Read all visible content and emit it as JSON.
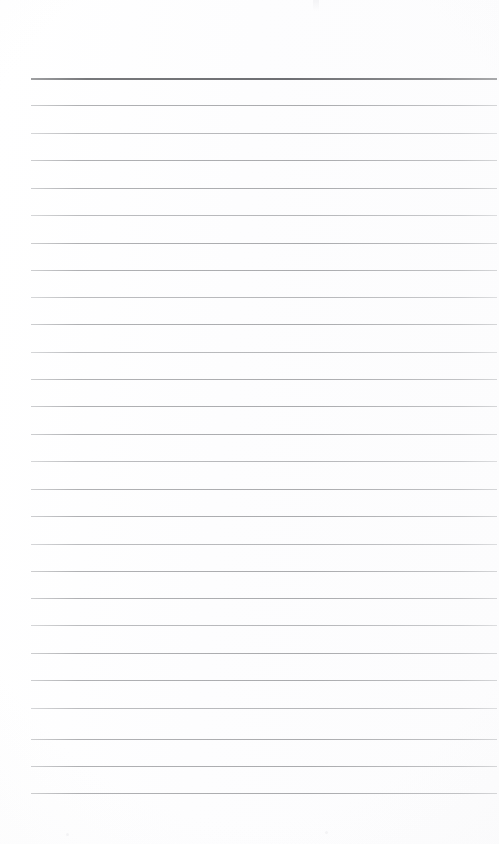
{
  "document": {
    "kind": "scanned-ruled-notebook-page",
    "title": "Blank Ruled Page",
    "content_text": "",
    "page_width": 499,
    "page_height": 844,
    "background_color": "#fefefe",
    "rule_color": "#b4b5b7",
    "header_rule_color": "#6e6f73",
    "margin_left": 31,
    "margin_right": 497,
    "first_rule_y": 78,
    "rule_spacing": 27.4,
    "rule_count": 27,
    "top_margin_blank_px": 78,
    "bottom_margin_blank_px": 51,
    "has_vertical_margin_line": false,
    "has_text": false,
    "rules": [
      {
        "index": 0,
        "y": 78,
        "weight": "heavy",
        "x_start": 31,
        "x_end": 497
      },
      {
        "index": 1,
        "y": 105,
        "weight": "light",
        "x_start": 31,
        "x_end": 497
      },
      {
        "index": 2,
        "y": 133,
        "weight": "faint",
        "x_start": 31,
        "x_end": 497
      },
      {
        "index": 3,
        "y": 160,
        "weight": "light",
        "x_start": 31,
        "x_end": 497
      },
      {
        "index": 4,
        "y": 188,
        "weight": "light",
        "x_start": 31,
        "x_end": 497
      },
      {
        "index": 5,
        "y": 215,
        "weight": "faint",
        "x_start": 31,
        "x_end": 497
      },
      {
        "index": 6,
        "y": 243,
        "weight": "light",
        "x_start": 31,
        "x_end": 497
      },
      {
        "index": 7,
        "y": 270,
        "weight": "light",
        "x_start": 31,
        "x_end": 497
      },
      {
        "index": 8,
        "y": 297,
        "weight": "faint",
        "x_start": 31,
        "x_end": 497
      },
      {
        "index": 9,
        "y": 324,
        "weight": "light",
        "x_start": 31,
        "x_end": 497
      },
      {
        "index": 10,
        "y": 352,
        "weight": "faint",
        "x_start": 31,
        "x_end": 497
      },
      {
        "index": 11,
        "y": 379,
        "weight": "light",
        "x_start": 31,
        "x_end": 497
      },
      {
        "index": 12,
        "y": 406,
        "weight": "light",
        "x_start": 31,
        "x_end": 497
      },
      {
        "index": 13,
        "y": 434,
        "weight": "light",
        "x_start": 31,
        "x_end": 497
      },
      {
        "index": 14,
        "y": 461,
        "weight": "faint",
        "x_start": 31,
        "x_end": 497
      },
      {
        "index": 15,
        "y": 489,
        "weight": "light",
        "x_start": 31,
        "x_end": 497
      },
      {
        "index": 16,
        "y": 516,
        "weight": "light",
        "x_start": 31,
        "x_end": 497
      },
      {
        "index": 17,
        "y": 544,
        "weight": "faint",
        "x_start": 31,
        "x_end": 497
      },
      {
        "index": 18,
        "y": 571,
        "weight": "light",
        "x_start": 31,
        "x_end": 497
      },
      {
        "index": 19,
        "y": 598,
        "weight": "light",
        "x_start": 31,
        "x_end": 497
      },
      {
        "index": 20,
        "y": 625,
        "weight": "faint",
        "x_start": 31,
        "x_end": 497
      },
      {
        "index": 21,
        "y": 653,
        "weight": "light",
        "x_start": 31,
        "x_end": 497
      },
      {
        "index": 22,
        "y": 680,
        "weight": "light",
        "x_start": 31,
        "x_end": 497
      },
      {
        "index": 23,
        "y": 708,
        "weight": "faint",
        "x_start": 31,
        "x_end": 497
      },
      {
        "index": 24,
        "y": 739,
        "weight": "light",
        "x_start": 31,
        "x_end": 497
      },
      {
        "index": 25,
        "y": 766,
        "weight": "light",
        "x_start": 31,
        "x_end": 497
      },
      {
        "index": 26,
        "y": 793,
        "weight": "light",
        "x_start": 31,
        "x_end": 497
      }
    ],
    "artifacts": [
      {
        "name": "top-edge-smudge",
        "x": 313,
        "y": 0,
        "width": 6,
        "height": 11
      },
      {
        "name": "scan-speck-left",
        "x": 66,
        "y": 833,
        "width": 3,
        "height": 3
      },
      {
        "name": "scan-speck-right",
        "x": 325,
        "y": 831,
        "width": 3,
        "height": 3
      }
    ]
  }
}
